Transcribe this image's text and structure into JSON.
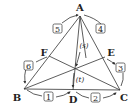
{
  "diagram": {
    "type": "triangle-cevians",
    "vertices": [
      {
        "id": "A",
        "label": "A",
        "x": 80,
        "y": 16,
        "lx": 80,
        "ly": 9
      },
      {
        "id": "B",
        "label": "B",
        "x": 24,
        "y": 89,
        "lx": 17,
        "ly": 100
      },
      {
        "id": "C",
        "label": "C",
        "x": 120,
        "y": 90,
        "lx": 124,
        "ly": 100
      },
      {
        "id": "D",
        "label": "D",
        "x": 73,
        "y": 90,
        "lx": 73,
        "ly": 102
      },
      {
        "id": "E",
        "label": "E",
        "x": 105,
        "y": 57,
        "lx": 112,
        "ly": 55
      },
      {
        "id": "F",
        "label": "F",
        "x": 49,
        "y": 56,
        "lx": 43,
        "ly": 55
      }
    ],
    "intersection": {
      "x": 74,
      "y": 69
    },
    "numbered_boxes": [
      {
        "label": "1",
        "x": 49,
        "y": 97
      },
      {
        "label": "2",
        "x": 96,
        "y": 98
      },
      {
        "label": "3",
        "x": 121,
        "y": 68
      },
      {
        "label": "4",
        "x": 101,
        "y": 29
      },
      {
        "label": "5",
        "x": 58,
        "y": 29
      },
      {
        "label": "6",
        "x": 29,
        "y": 66
      }
    ],
    "parameters": [
      {
        "label": "(s)",
        "x": 82,
        "y": 47
      },
      {
        "label": "(t)",
        "x": 79,
        "y": 81
      }
    ],
    "colors": {
      "stroke": "#333333",
      "text": "#222222",
      "background": "#ffffff"
    }
  }
}
